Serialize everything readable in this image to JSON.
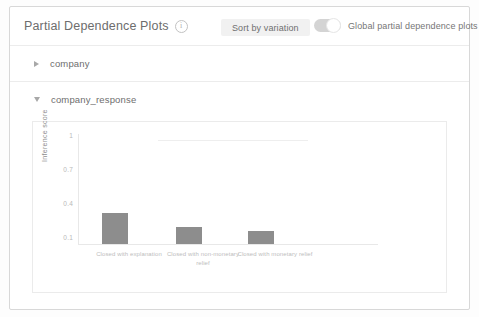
{
  "header": {
    "title": "Partial Dependence Plots",
    "info_icon": "info-icon",
    "sort_button_label": "Sort by variation",
    "toggle_label": "Global partial dependence plots",
    "toggle_state": "on"
  },
  "accordion": {
    "items": [
      {
        "label": "company",
        "expanded": false,
        "caret": "chevron-right-icon"
      },
      {
        "label": "company_response",
        "expanded": true,
        "caret": "chevron-down-icon"
      }
    ]
  },
  "colors": {
    "bar": "#8d8d8d",
    "button_bg": "#f1f1f1",
    "toggle_track": "#d4d4d4",
    "card_border": "#d8d8d8",
    "axis": "#e8e8e8"
  },
  "chart_data": {
    "type": "bar",
    "title": "",
    "xlabel": "",
    "ylabel": "Inference score",
    "categories": [
      "Closed with explanation",
      "Closed with non-monetary relief",
      "Closed with monetary relief"
    ],
    "values": [
      0.28,
      0.15,
      0.12
    ],
    "ytick_labels": [
      "1",
      "0.7",
      "0.4",
      "0.1"
    ],
    "ytick_values": [
      1,
      0.7,
      0.4,
      0.1
    ],
    "ylim": [
      0,
      1.1
    ],
    "grid": false,
    "legend": "none",
    "annotations": [
      {
        "type": "reference-line",
        "orientation": "horizontal",
        "value": 1.0
      }
    ]
  }
}
